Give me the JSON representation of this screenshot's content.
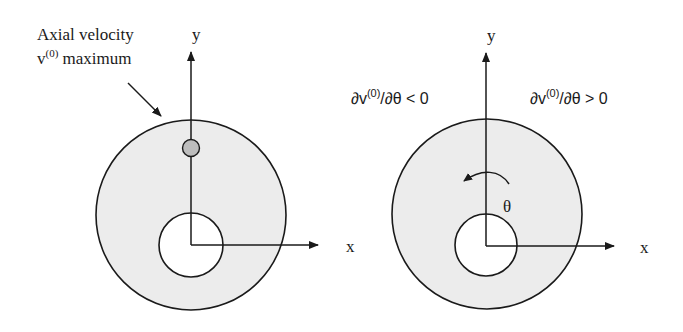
{
  "figure": {
    "colors": {
      "stroke": "#1a1a1a",
      "annulus_fill": "#ececec",
      "inner_fill": "#ffffff",
      "marker_fill": "#bdbdbd"
    },
    "left_panel": {
      "annotation": {
        "line1": "Axial velocity",
        "line2_base": "v",
        "line2_sup": "(0)",
        "line2_rest": " maximum"
      },
      "axis_y_label": "y",
      "axis_x_label": "x",
      "marker": "velocity-maximum-point"
    },
    "right_panel": {
      "left_region_label": {
        "pre": "∂v",
        "sup": "(0)",
        "post": "/∂θ < 0"
      },
      "right_region_label": {
        "pre": "∂v",
        "sup": "(0)",
        "post": "/∂θ > 0"
      },
      "angle_label": "θ",
      "axis_y_label": "y",
      "axis_x_label": "x"
    }
  }
}
